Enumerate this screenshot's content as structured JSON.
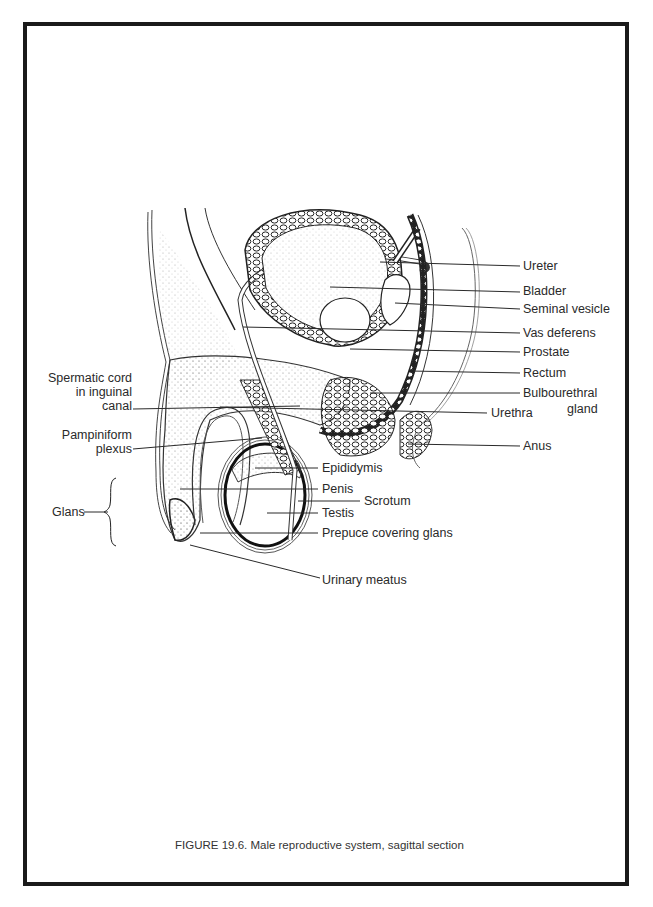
{
  "figure": {
    "caption": "FIGURE 19.6. Male reproductive system, sagittal section",
    "border_color": "#1a1a1a",
    "line_color": "#2a2a2a"
  },
  "labels_right": [
    {
      "id": "ureter",
      "text": "Ureter"
    },
    {
      "id": "bladder",
      "text": "Bladder"
    },
    {
      "id": "seminal-vesicle",
      "text": "Seminal vesicle"
    },
    {
      "id": "vas-deferens",
      "text": "Vas deferens"
    },
    {
      "id": "prostate",
      "text": "Prostate"
    },
    {
      "id": "rectum",
      "text": "Rectum"
    },
    {
      "id": "bulbourethral-gland",
      "text": "Bulbourethral",
      "text2": "gland"
    },
    {
      "id": "urethra",
      "text": "Urethra"
    },
    {
      "id": "anus",
      "text": "Anus"
    }
  ],
  "labels_left": [
    {
      "id": "spermatic-cord",
      "line1": "Spermatic cord",
      "line2": "in inguinal",
      "line3": "canal"
    },
    {
      "id": "pampiniform-plexus",
      "line1": "Pampiniform",
      "line2": "plexus"
    },
    {
      "id": "glans",
      "text": "Glans"
    }
  ],
  "labels_bottom": [
    {
      "id": "epididymis",
      "text": "Epididymis"
    },
    {
      "id": "penis",
      "text": "Penis"
    },
    {
      "id": "scrotum",
      "text": "Scrotum"
    },
    {
      "id": "testis",
      "text": "Testis"
    },
    {
      "id": "prepuce",
      "text": "Prepuce covering glans"
    },
    {
      "id": "urinary-meatus",
      "text": "Urinary meatus"
    }
  ]
}
